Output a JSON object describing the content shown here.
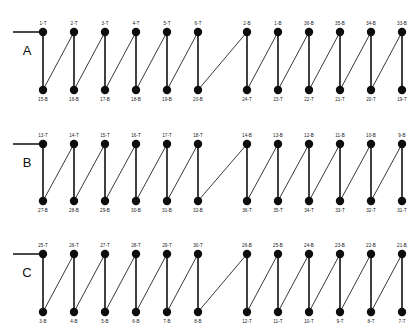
{
  "figure": {
    "type": "node-link-diagram",
    "background_color": "#ffffff",
    "node_color": "#0d0d0d",
    "vertical_edge_color": "#111111",
    "diagonal_edge_color": "#3a3a3a",
    "node_radius": 4.2,
    "column_x": [
      43,
      74,
      105,
      136,
      167,
      198,
      247,
      278,
      309,
      340,
      371,
      402
    ],
    "lead_in_x_start": 13
  },
  "rows": [
    {
      "letter": "A",
      "letter_x": 27,
      "letter_y": 55,
      "top_y": 32,
      "bottom_y": 90,
      "top_labels": [
        "1-T",
        "2-T",
        "3-T",
        "4-T",
        "5-T",
        "6-T",
        "2-B",
        "1-B",
        "36-B",
        "35-B",
        "34-B",
        "33-B"
      ],
      "bottom_labels": [
        "15-B",
        "16-B",
        "17-B",
        "18-B",
        "19-B",
        "20-B",
        "24-T",
        "23-T",
        "22-T",
        "21-T",
        "20-T",
        "19-T"
      ]
    },
    {
      "letter": "B",
      "letter_x": 27,
      "letter_y": 167,
      "top_y": 144,
      "bottom_y": 201,
      "top_labels": [
        "13-T",
        "14-T",
        "15-T",
        "16-T",
        "17-T",
        "18-T",
        "14-B",
        "13-B",
        "12-B",
        "11-B",
        "10-B",
        "9-B"
      ],
      "bottom_labels": [
        "27-B",
        "28-B",
        "29-B",
        "30-B",
        "31-B",
        "32-B",
        "36-T",
        "35-T",
        "34-T",
        "33-T",
        "32-T",
        "31-T"
      ]
    },
    {
      "letter": "C",
      "letter_x": 27,
      "letter_y": 277,
      "top_y": 254,
      "bottom_y": 312,
      "top_labels": [
        "25-T",
        "26-T",
        "27-T",
        "28-T",
        "29-T",
        "30-T",
        "26-B",
        "25-B",
        "24-B",
        "23-B",
        "22-B",
        "21-B"
      ],
      "bottom_labels": [
        "3-B",
        "4-B",
        "5-B",
        "6-B",
        "7-B",
        "8-B",
        "12-T",
        "11-T",
        "10-T",
        "9-T",
        "8-T",
        "7-T"
      ]
    }
  ],
  "chart_data": {
    "type": "table",
    "title": "",
    "columns": [
      "column",
      "A-top",
      "A-bottom",
      "B-top",
      "B-bottom",
      "C-top",
      "C-bottom"
    ],
    "rows": [
      [
        1,
        "1-T",
        "15-B",
        "13-T",
        "27-B",
        "25-T",
        "3-B"
      ],
      [
        2,
        "2-T",
        "16-B",
        "14-T",
        "28-B",
        "26-T",
        "4-B"
      ],
      [
        3,
        "3-T",
        "17-B",
        "15-T",
        "29-B",
        "27-T",
        "5-B"
      ],
      [
        4,
        "4-T",
        "18-B",
        "16-T",
        "30-B",
        "28-T",
        "6-B"
      ],
      [
        5,
        "5-T",
        "19-B",
        "17-T",
        "31-B",
        "29-T",
        "7-B"
      ],
      [
        6,
        "6-T",
        "20-B",
        "18-T",
        "32-B",
        "30-T",
        "8-B"
      ],
      [
        7,
        "2-B",
        "24-T",
        "14-B",
        "36-T",
        "26-B",
        "12-T"
      ],
      [
        8,
        "1-B",
        "23-T",
        "13-B",
        "35-T",
        "25-B",
        "11-T"
      ],
      [
        9,
        "36-B",
        "22-T",
        "12-B",
        "34-T",
        "24-B",
        "10-T"
      ],
      [
        10,
        "35-B",
        "21-T",
        "11-B",
        "33-T",
        "23-B",
        "9-T"
      ],
      [
        11,
        "34-B",
        "20-T",
        "10-B",
        "32-T",
        "22-B",
        "8-T"
      ],
      [
        12,
        "33-B",
        "19-T",
        "9-B",
        "31-T",
        "21-B",
        "7-T"
      ]
    ]
  }
}
